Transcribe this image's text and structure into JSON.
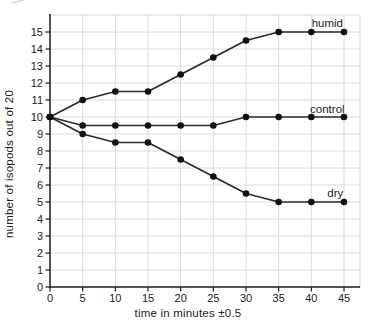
{
  "chart_data": {
    "type": "line",
    "title": "",
    "xlabel": "time in minutes ±0.5",
    "ylabel": "number of isopods out of 20",
    "x": [
      0,
      5,
      10,
      15,
      20,
      25,
      30,
      35,
      40,
      45
    ],
    "x_tick_labels": [
      "0",
      "5",
      "10",
      "15",
      "20",
      "25",
      "30",
      "35",
      "40",
      "45"
    ],
    "y_tick_labels": [
      "0",
      "1",
      "2",
      "3",
      "4",
      "5",
      "6",
      "7",
      "8",
      "9",
      "10",
      "11",
      "12",
      "13",
      "14",
      "15"
    ],
    "xlim": [
      0,
      47.5
    ],
    "ylim": [
      0,
      16
    ],
    "grid": true,
    "legend_position": "inline-end-of-line",
    "series": [
      {
        "name": "humid",
        "values": [
          10,
          11,
          11.5,
          11.5,
          12.5,
          13.5,
          14.5,
          15,
          15,
          15
        ]
      },
      {
        "name": "control",
        "values": [
          10,
          9.5,
          9.5,
          9.5,
          9.5,
          9.5,
          10,
          10,
          10,
          10
        ]
      },
      {
        "name": "dry",
        "values": [
          10,
          9,
          8.5,
          8.5,
          7.5,
          6.5,
          5.5,
          5,
          5,
          5
        ]
      }
    ],
    "colors": {
      "line": "#2a2a2a",
      "marker": "#111111",
      "grid": "#dadada",
      "axis": "#1a1a1a",
      "text": "#222222",
      "background": "#ffffff"
    }
  }
}
